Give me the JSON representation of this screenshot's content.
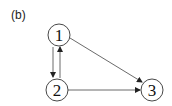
{
  "panel_label": "(b)",
  "nodes": [
    {
      "id": "1",
      "label": "1",
      "cx": 59,
      "cy": 35
    },
    {
      "id": "2",
      "label": "2",
      "cx": 57,
      "cy": 90
    },
    {
      "id": "3",
      "label": "3",
      "cx": 152,
      "cy": 90
    }
  ],
  "edges": [
    {
      "from": "1",
      "to": "2"
    },
    {
      "from": "2",
      "to": "1"
    },
    {
      "from": "1",
      "to": "3"
    },
    {
      "from": "2",
      "to": "3"
    }
  ],
  "colors": {
    "stroke": "#333333",
    "background": "#ffffff"
  }
}
